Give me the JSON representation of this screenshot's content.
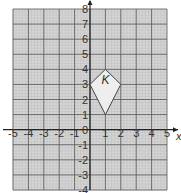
{
  "diagram": {
    "x_range": [
      -5,
      5
    ],
    "y_range": [
      -4,
      8
    ],
    "x_axis_label": "x",
    "y_axis_label": "y",
    "x_ticks": [
      "-5",
      "-4",
      "-3",
      "-2",
      "-1",
      "1",
      "2",
      "3",
      "4",
      "5"
    ],
    "y_ticks": [
      "8",
      "7",
      "6",
      "5",
      "4",
      "3",
      "2",
      "1",
      "-1",
      "-2",
      "-3",
      "-4"
    ],
    "origin_label": "0",
    "shape": {
      "label": "K",
      "vertices": [
        [
          0,
          3
        ],
        [
          1,
          4
        ],
        [
          2,
          3
        ],
        [
          1,
          1
        ]
      ],
      "label_position": [
        1,
        3.3
      ]
    },
    "colors": {
      "grid_bg": "#d6d6d6",
      "grid_major": "#555555",
      "grid_minor": "#bdbdbd",
      "shape_fill": "#eeeeee",
      "shape_stroke": "#444444"
    }
  }
}
